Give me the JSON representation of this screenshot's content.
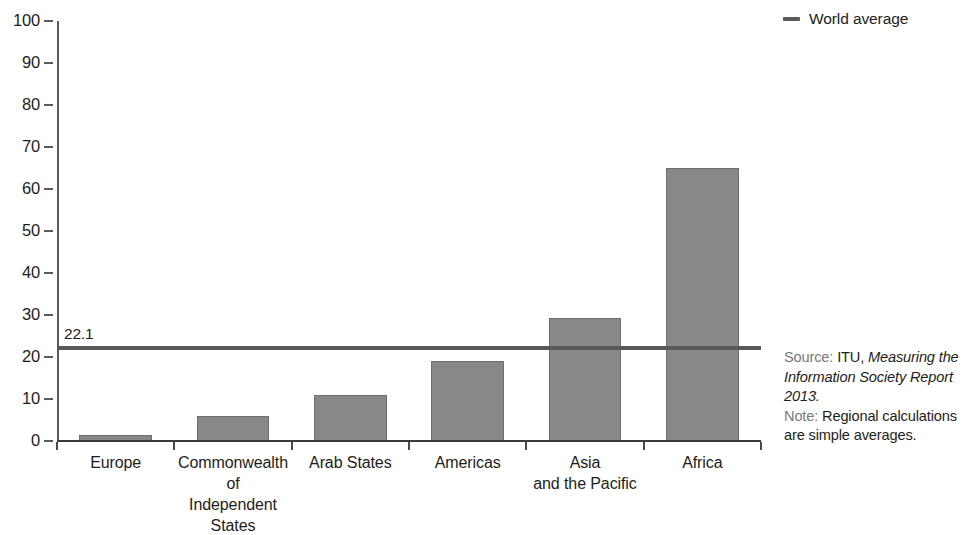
{
  "legend": {
    "swatch_name": "world-average-line-swatch",
    "label": "World average",
    "color": "#58595b"
  },
  "axis": {
    "y_ticks": [
      "100",
      "90",
      "80",
      "70",
      "60",
      "50",
      "40",
      "30",
      "20",
      "10",
      "0"
    ]
  },
  "annotations": {
    "world_average_label": "22.1"
  },
  "source": {
    "source_keyword": "Source:",
    "source_plain": " ITU, ",
    "source_italic": "Measuring the Information Society Report 2013.",
    "note_keyword": "Note:",
    "note_text": " Regional calculations are simple averages."
  },
  "chart_data": {
    "type": "bar",
    "title": "",
    "xlabel": "",
    "ylabel": "",
    "ylim": [
      0,
      100
    ],
    "ytick_step": 10,
    "grid": false,
    "legend_position": "top-right",
    "bar_color": "#888888",
    "categories": [
      "Europe",
      "Commonwealth of Independent States",
      "Arab States",
      "Americas",
      "Asia and the Pacific",
      "Africa"
    ],
    "category_label_lines": [
      [
        "Europe"
      ],
      [
        "Commonwealth",
        "of",
        "Independent States"
      ],
      [
        "Arab States"
      ],
      [
        "Americas"
      ],
      [
        "Asia",
        "and the Pacific"
      ],
      [
        "Africa"
      ]
    ],
    "values": [
      1.5,
      6.0,
      11.0,
      19.0,
      29.3,
      65.0
    ],
    "reference_line": {
      "name": "World average",
      "value": 22.1,
      "label": "22.1",
      "color": "#58595b"
    }
  }
}
